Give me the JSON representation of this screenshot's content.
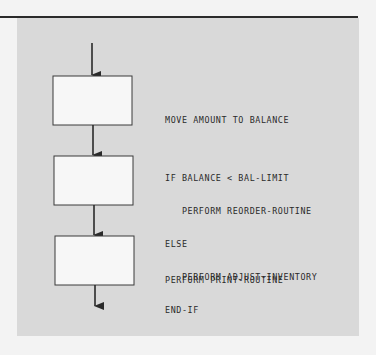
{
  "diagram": {
    "type": "flowchart",
    "colors": {
      "background": "#f3f3f3",
      "panel": "#d9d9d9",
      "box_fill": "#f7f7f7",
      "stroke": "#2a2a2a",
      "text": "#2a2a2a"
    },
    "steps": [
      {
        "id": "step-1",
        "lines": [
          "MOVE AMOUNT TO BALANCE"
        ]
      },
      {
        "id": "step-2",
        "lines": [
          "IF BALANCE < BAL-LIMIT",
          "   PERFORM REORDER-ROUTINE",
          "ELSE",
          "   PERFORM ADJUST-INVENTORY",
          "END-IF"
        ]
      },
      {
        "id": "step-3",
        "lines": [
          "PERFORM PRINT-ROUTINE"
        ]
      }
    ]
  }
}
